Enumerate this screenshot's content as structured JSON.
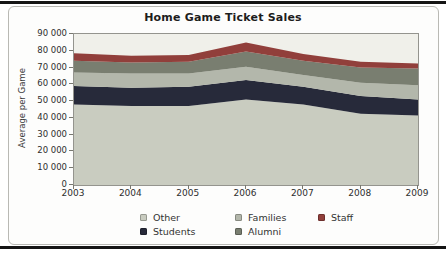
{
  "page": {
    "rule_color": "#151515"
  },
  "chart_data": {
    "type": "area",
    "stacked": true,
    "title": "Home Game Ticket Sales",
    "ylabel": "Average per Game",
    "categories": [
      "2003",
      "2004",
      "2005",
      "2006",
      "2007",
      "2008",
      "2009"
    ],
    "ylim": [
      0,
      90000
    ],
    "ytick_step": 10000,
    "ytick_labels": [
      "0",
      "10 000",
      "20 000",
      "30 000",
      "40 000",
      "50 000",
      "60 000",
      "70 000",
      "80 000",
      "90 000"
    ],
    "plot_bg": "#f0f0ea",
    "grid": false,
    "legend_position": "bottom",
    "legend_rows": [
      [
        "Other",
        "Families",
        "Staff"
      ],
      [
        "Students",
        "Alumni"
      ]
    ],
    "series": [
      {
        "name": "Other",
        "color": "#c9ccc0",
        "values": [
          48000,
          47000,
          47000,
          51000,
          48000,
          42500,
          41500
        ]
      },
      {
        "name": "Students",
        "color": "#272a3a",
        "values": [
          11000,
          11000,
          11500,
          11500,
          10500,
          10500,
          9500
        ]
      },
      {
        "name": "Families",
        "color": "#b3b7ab",
        "values": [
          8000,
          8500,
          8000,
          8000,
          7000,
          8000,
          8500
        ]
      },
      {
        "name": "Alumni",
        "color": "#797e70",
        "values": [
          7000,
          6500,
          7000,
          9000,
          8500,
          9000,
          10000
        ]
      },
      {
        "name": "Staff",
        "color": "#913f3b",
        "values": [
          4500,
          4000,
          4000,
          5500,
          4000,
          3500,
          3000
        ]
      }
    ],
    "stack_totals": [
      78500,
      77000,
      77500,
      85000,
      78000,
      73500,
      72500
    ]
  }
}
